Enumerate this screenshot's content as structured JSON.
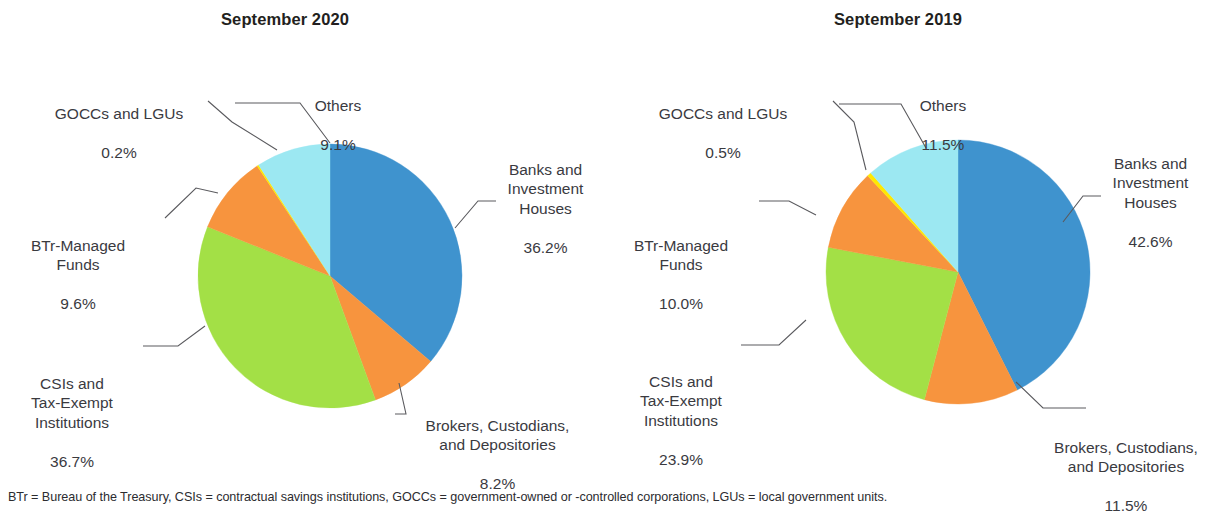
{
  "footnote": "BTr = Bureau of the Treasury, CSIs = contractual savings institutions, GOCCs = government-owned or -controlled corporations, LGUs = local government units.",
  "palette": {
    "banks": "#3f93ce",
    "brokers": "#f7943e",
    "csis": "#a3e046",
    "btr": "#f7943e",
    "goccs": "#ffe800",
    "others": "#9ce8f2"
  },
  "panels": [
    {
      "id": "panel-2020",
      "title": "September 2020",
      "labels": {
        "banks": {
          "name": "Banks and\nInvestment\nHouses",
          "value": "36.2%"
        },
        "brokers": {
          "name": "Brokers, Custodians,\nand Depositories",
          "value": "8.2%"
        },
        "csis": {
          "name": "CSIs and\nTax-Exempt\nInstitutions",
          "value": "36.7%"
        },
        "btr": {
          "name": "BTr-Managed\nFunds",
          "value": "9.6%"
        },
        "goccs": {
          "name": "GOCCs and LGUs",
          "value": "0.2%"
        },
        "others": {
          "name": "Others",
          "value": "9.1%"
        }
      }
    },
    {
      "id": "panel-2019",
      "title": "September 2019",
      "labels": {
        "banks": {
          "name": "Banks and\nInvestment\nHouses",
          "value": "42.6%"
        },
        "brokers": {
          "name": "Brokers, Custodians,\nand Depositories",
          "value": "11.5%"
        },
        "csis": {
          "name": "CSIs and\nTax-Exempt\nInstitutions",
          "value": "23.9%"
        },
        "btr": {
          "name": "BTr-Managed\nFunds",
          "value": "10.0%"
        },
        "goccs": {
          "name": "GOCCs and LGUs",
          "value": "0.5%"
        },
        "others": {
          "name": "Others",
          "value": "11.5%"
        }
      }
    }
  ],
  "chart_data": [
    {
      "type": "pie",
      "title": "September 2020",
      "categories": [
        "Banks and Investment Houses",
        "Brokers, Custodians, and Depositories",
        "CSIs and Tax-Exempt Institutions",
        "BTr-Managed Funds",
        "GOCCs and LGUs",
        "Others"
      ],
      "values": [
        36.2,
        8.2,
        36.7,
        9.6,
        0.2,
        9.1
      ],
      "colors": [
        "#3f93ce",
        "#f7943e",
        "#a3e046",
        "#f7943e",
        "#ffe800",
        "#9ce8f2"
      ],
      "unit": "percent",
      "start_angle_deg": 0,
      "direction": "clockwise",
      "legend": "callout-labels"
    },
    {
      "type": "pie",
      "title": "September 2019",
      "categories": [
        "Banks and Investment Houses",
        "Brokers, Custodians, and Depositories",
        "CSIs and Tax-Exempt Institutions",
        "BTr-Managed Funds",
        "GOCCs and LGUs",
        "Others"
      ],
      "values": [
        42.6,
        11.5,
        23.9,
        10.0,
        0.5,
        11.5
      ],
      "colors": [
        "#3f93ce",
        "#f7943e",
        "#a3e046",
        "#f7943e",
        "#ffe800",
        "#9ce8f2"
      ],
      "unit": "percent",
      "start_angle_deg": 0,
      "direction": "clockwise",
      "legend": "callout-labels"
    }
  ]
}
